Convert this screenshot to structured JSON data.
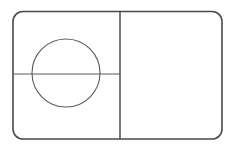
{
  "canvas": {
    "width": 234,
    "height": 152,
    "background_color": "#ffffff",
    "title": "Line drawing: rounded rectangle divided into panels with an inscribed circle"
  },
  "palette": {
    "outline_color": "#4a4a4a",
    "divider_color": "#3f3f3f",
    "circle_color": "#5a5a5a",
    "background_color": "#ffffff"
  },
  "shapes": {
    "outer_rectangle": {
      "name": "rounded-rectangle-outline",
      "x": 13,
      "y": 11.5,
      "width": 209,
      "height": 127.5,
      "corner_radius": 10,
      "stroke": "#4a4a4a",
      "stroke_width": 1.6,
      "fill": "none"
    },
    "vertical_divider": {
      "name": "vertical-divider-line",
      "x1": 120,
      "y1": 11.5,
      "x2": 120,
      "y2": 139,
      "stroke": "#3f3f3f",
      "stroke_width": 1.4
    },
    "horizontal_divider": {
      "name": "horizontal-divider-line",
      "x1": 13,
      "y1": 74,
      "x2": 120,
      "y2": 74,
      "stroke": "#5a5a5a",
      "stroke_width": 1.2
    },
    "circle": {
      "name": "inscribed-circle",
      "cx": 66,
      "cy": 73,
      "r": 34,
      "stroke": "#5a5a5a",
      "stroke_width": 1.1,
      "fill": "none"
    }
  },
  "regions": {
    "left_upper": "left-upper-panel",
    "left_lower": "left-lower-panel",
    "right": "right-panel"
  }
}
